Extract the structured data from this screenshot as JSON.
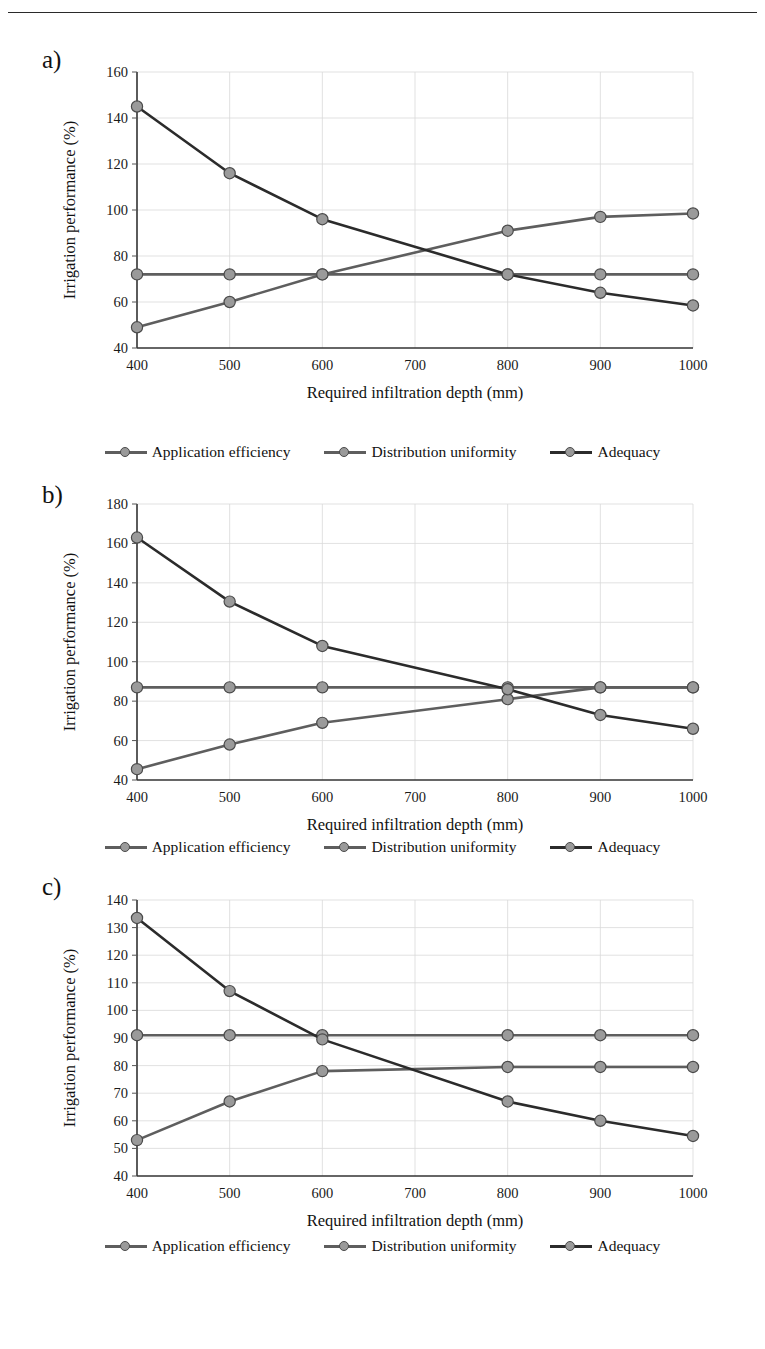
{
  "page": {
    "top_rule": true
  },
  "panels": [
    {
      "label": "a)"
    },
    {
      "label": "b)"
    },
    {
      "label": "c)"
    }
  ],
  "legend": {
    "items": [
      {
        "label": "Application efficiency",
        "color": "#5e5e5e",
        "marker": "circle"
      },
      {
        "label": "Distribution uniformity",
        "color": "#5e5e5e",
        "marker": "circle"
      },
      {
        "label": "Adequacy",
        "color": "#2b2b2b",
        "marker": "circle"
      }
    ]
  },
  "chart_data": [
    {
      "type": "line",
      "title": "a)",
      "xlabel": "Required infiltration depth (mm)",
      "ylabel": "Irrigation performance (%)",
      "x": [
        400,
        500,
        600,
        800,
        900,
        1000
      ],
      "categories": [
        "400",
        "500",
        "600",
        "700",
        "800",
        "900",
        "1000"
      ],
      "xlim": [
        400,
        1000
      ],
      "ylim": [
        40,
        160
      ],
      "yticks": [
        40,
        60,
        80,
        100,
        120,
        140,
        160
      ],
      "xticks": [
        400,
        500,
        600,
        700,
        800,
        900,
        1000
      ],
      "grid": true,
      "legend_position": "bottom",
      "series": [
        {
          "name": "Application efficiency",
          "color": "#5e5e5e",
          "values": [
            49,
            60,
            72,
            91,
            97,
            98.5
          ]
        },
        {
          "name": "Distribution uniformity",
          "color": "#5e5e5e",
          "values": [
            72,
            72,
            72,
            72,
            72,
            72
          ]
        },
        {
          "name": "Adequacy",
          "color": "#2b2b2b",
          "values": [
            145,
            116,
            96,
            72,
            64,
            58.5
          ]
        }
      ]
    },
    {
      "type": "line",
      "title": "b)",
      "xlabel": "Required infiltration depth (mm)",
      "ylabel": "Irrigation performance (%)",
      "x": [
        400,
        500,
        600,
        800,
        900,
        1000
      ],
      "categories": [
        "400",
        "500",
        "600",
        "700",
        "800",
        "900",
        "1000"
      ],
      "xlim": [
        400,
        1000
      ],
      "ylim": [
        40,
        180
      ],
      "yticks": [
        40,
        60,
        80,
        100,
        120,
        140,
        160,
        180
      ],
      "xticks": [
        400,
        500,
        600,
        700,
        800,
        900,
        1000
      ],
      "grid": true,
      "legend_position": "bottom",
      "series": [
        {
          "name": "Application efficiency",
          "color": "#5e5e5e",
          "values": [
            45.5,
            58,
            69,
            81,
            87,
            87
          ]
        },
        {
          "name": "Distribution uniformity",
          "color": "#5e5e5e",
          "values": [
            87,
            87,
            87,
            87,
            87,
            87
          ]
        },
        {
          "name": "Adequacy",
          "color": "#2b2b2b",
          "values": [
            163,
            130.5,
            108,
            86,
            73,
            66
          ]
        }
      ]
    },
    {
      "type": "line",
      "title": "c)",
      "xlabel": "Required infiltration depth (mm)",
      "ylabel": "Irrigation performance (%)",
      "x": [
        400,
        500,
        600,
        800,
        900,
        1000
      ],
      "categories": [
        "400",
        "500",
        "600",
        "700",
        "800",
        "900",
        "1000"
      ],
      "xlim": [
        400,
        1000
      ],
      "ylim": [
        40,
        140
      ],
      "yticks": [
        40,
        50,
        60,
        70,
        80,
        90,
        100,
        110,
        120,
        130,
        140
      ],
      "xticks": [
        400,
        500,
        600,
        700,
        800,
        900,
        1000
      ],
      "grid": true,
      "legend_position": "bottom",
      "series": [
        {
          "name": "Application efficiency",
          "color": "#5e5e5e",
          "values": [
            53,
            67,
            78,
            79.5,
            79.5,
            79.5
          ]
        },
        {
          "name": "Distribution uniformity",
          "color": "#5e5e5e",
          "values": [
            91,
            91,
            91,
            91,
            91,
            91
          ]
        },
        {
          "name": "Adequacy",
          "color": "#2b2b2b",
          "values": [
            133.5,
            107,
            89.5,
            67,
            60,
            54.5
          ]
        }
      ]
    }
  ]
}
